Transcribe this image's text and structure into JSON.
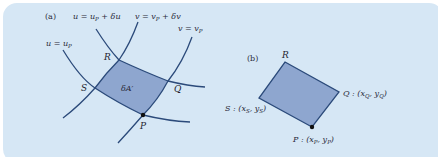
{
  "figure": {
    "background_color": "#d6e7f5",
    "curve_color": "#2b4a7a",
    "fill_color": "#8ea6cf",
    "panel_a": {
      "label": "(a)",
      "curves": {
        "u_shift": {
          "lhs": "u",
          "eq": " = ",
          "rhs": "u",
          "rhs_sub": "P",
          "tail": " + δu"
        },
        "v_shift": {
          "lhs": "v",
          "eq": " = ",
          "rhs": "v",
          "rhs_sub": "P",
          "tail": " + δv"
        },
        "u_base": {
          "lhs": "u",
          "eq": " = ",
          "rhs": "u",
          "rhs_sub": "P"
        },
        "v_base": {
          "lhs": "v",
          "eq": " = ",
          "rhs": "v",
          "rhs_sub": "P"
        }
      },
      "points": {
        "R": "R",
        "S": "S",
        "Q": "Q",
        "P": "P"
      },
      "area_label": "δA′"
    },
    "panel_b": {
      "label": "(b)",
      "points": {
        "R": {
          "name": "R"
        },
        "Q": {
          "name": "Q",
          "coord_prefix": " : (",
          "x": "x",
          "y": "y",
          "sub": "Q"
        },
        "S": {
          "name": "S",
          "coord_prefix": " : (",
          "x": "x",
          "y": "y",
          "sub": "S"
        },
        "P": {
          "name": "P",
          "coord_prefix": " : (",
          "x": "x",
          "y": "y",
          "sub": "P"
        }
      }
    }
  }
}
